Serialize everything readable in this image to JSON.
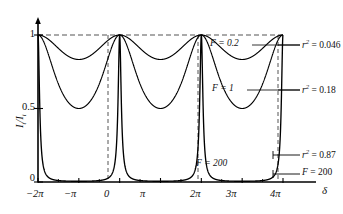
{
  "figure": {
    "y_axis_title_main": "I",
    "y_axis_title_sub1": "t",
    "y_axis_title_slash": "/I",
    "y_axis_title_sub2": "i",
    "x_axis_title": "δ"
  },
  "ticks": {
    "y": [
      {
        "label": "0",
        "value": 0
      },
      {
        "label": "0.5",
        "value": 0.5
      },
      {
        "label": "1",
        "value": 1
      }
    ],
    "x": [
      {
        "label": "−2π",
        "value": -6.2832
      },
      {
        "label": "−π",
        "value": -3.1416
      },
      {
        "label": "0",
        "value": 0
      },
      {
        "label": "π",
        "value": 3.1416
      },
      {
        "label": "2π",
        "value": 6.2832
      },
      {
        "label": "3π",
        "value": 9.4248
      },
      {
        "label": "4π",
        "value": 12.5664
      }
    ]
  },
  "inline_labels": [
    {
      "name": "curve-label-f02",
      "text": "F = 0.2"
    },
    {
      "name": "curve-label-f1",
      "text": "F = 1"
    },
    {
      "name": "curve-label-f200",
      "text": "F = 200"
    }
  ],
  "right_annotations": [
    {
      "name": "r2-0046",
      "pre": "r",
      "sup": "2",
      "post": " = 0.046"
    },
    {
      "name": "r2-018",
      "pre": "r",
      "sup": "2",
      "post": " = 0.18"
    },
    {
      "name": "r2-087",
      "pre": "r",
      "sup": "2",
      "post": " = 0.87"
    },
    {
      "name": "f-200",
      "pre": "F",
      "sup": "",
      "post": " = 200"
    }
  ],
  "chart_data": {
    "type": "line",
    "title": "",
    "subtitle": "",
    "xlabel": "δ",
    "ylabel": "I_t/I_i",
    "xlim": [
      -6.2832,
      12.5664
    ],
    "ylim": [
      0,
      1.0
    ],
    "xtick_labels": [
      "−2π",
      "−π",
      "0",
      "π",
      "2π",
      "3π",
      "4π"
    ],
    "xtick_values": [
      -6.2832,
      -3.1416,
      0,
      3.1416,
      6.2832,
      9.4248,
      12.5664
    ],
    "ytick_labels": [
      "0",
      "0.5",
      "1"
    ],
    "ytick_values": [
      0,
      0.5,
      1
    ],
    "grid": false,
    "legend": "inline-annotations",
    "formula": "I_t/I_i = 1 / (1 + F*sin^2(delta/2))",
    "series": [
      {
        "name": "F = 0.2",
        "F": 0.2,
        "r_squared": 0.046,
        "minimum_value": 0.833,
        "maximum_value": 1.0
      },
      {
        "name": "F = 1",
        "F": 1.0,
        "r_squared": 0.18,
        "minimum_value": 0.5,
        "maximum_value": 1.0
      },
      {
        "name": "F = 200",
        "F": 200,
        "r_squared": 0.87,
        "minimum_value": 0.00498,
        "maximum_value": 1.0
      }
    ],
    "annotations": [
      {
        "text": "F = 0.2",
        "kind": "curve-label"
      },
      {
        "text": "F = 1",
        "kind": "curve-label"
      },
      {
        "text": "F = 200",
        "kind": "curve-label"
      },
      {
        "text": "r² = 0.046",
        "kind": "right-label"
      },
      {
        "text": "r² = 0.18",
        "kind": "right-label"
      },
      {
        "text": "r² = 0.87",
        "kind": "right-label"
      },
      {
        "text": "F = 200",
        "kind": "right-label"
      }
    ]
  }
}
